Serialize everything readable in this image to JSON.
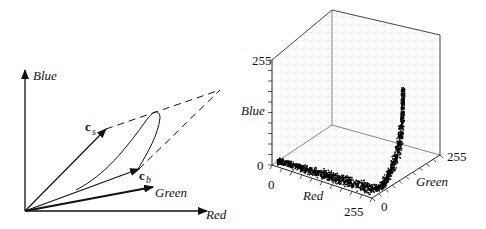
{
  "left_diagram": {
    "axes": {
      "blue": "Blue",
      "green": "Green",
      "red": "Red"
    },
    "vectors": {
      "specular": {
        "base": "c",
        "subscript": "s"
      },
      "body": {
        "base": "c",
        "subscript": "b"
      }
    }
  },
  "right_plot": {
    "axes": {
      "blue": {
        "label": "Blue",
        "min": "0",
        "max": "255"
      },
      "red": {
        "label": "Red",
        "min": "0",
        "max": "255"
      },
      "green": {
        "label": "Green",
        "min": "0",
        "max": "255"
      }
    }
  },
  "chart_data": {
    "type": "scatter",
    "dimensions": 3,
    "axes": [
      "Red",
      "Green",
      "Blue"
    ],
    "ranges": {
      "Red": [
        0,
        255
      ],
      "Green": [
        0,
        255
      ],
      "Blue": [
        0,
        255
      ]
    },
    "grid": true,
    "colors": {
      "points": "#000000",
      "grid": "#9a9a9a"
    }
  }
}
